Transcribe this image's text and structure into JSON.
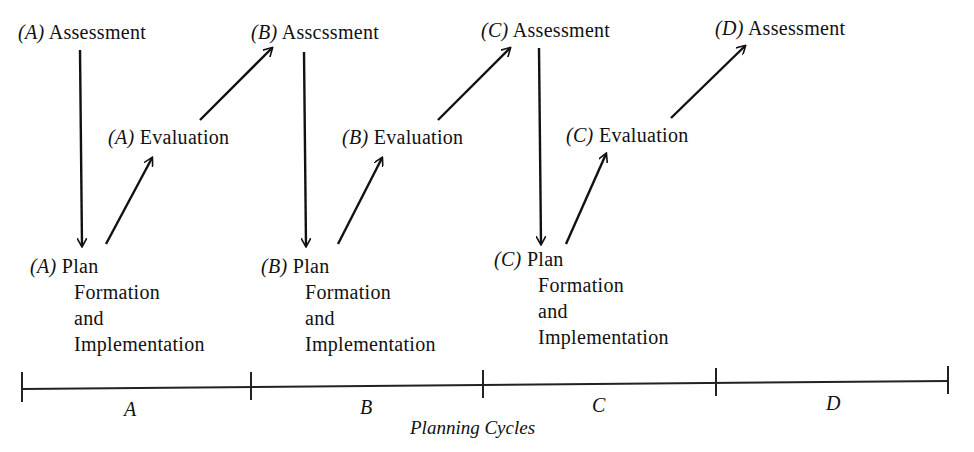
{
  "nodes": {
    "a_assessment": {
      "prefix": "(A)",
      "text": "Assessment"
    },
    "a_evaluation": {
      "prefix": "(A)",
      "text": "Evaluation"
    },
    "a_plan": {
      "prefix": "(A)",
      "lines": [
        "Plan",
        "Formation",
        "and",
        "Implementation"
      ]
    },
    "b_assessment": {
      "prefix": "(B)",
      "text": "Asscssment"
    },
    "b_evaluation": {
      "prefix": "(B)",
      "text": "Evaluation"
    },
    "b_plan": {
      "prefix": "(B)",
      "lines": [
        "Plan",
        "Formation",
        "and",
        "Implementation"
      ]
    },
    "c_assessment": {
      "prefix": "(C)",
      "text": "Assessment"
    },
    "c_evaluation": {
      "prefix": "(C)",
      "text": "Evaluation"
    },
    "c_plan": {
      "prefix": "(C)",
      "lines": [
        "Plan",
        "Formation",
        "and",
        "Implementation"
      ]
    },
    "d_assessment": {
      "prefix": "(D)",
      "text": "Assessment"
    }
  },
  "timeline": {
    "segments": [
      "A",
      "B",
      "C",
      "D"
    ],
    "caption": "Planning Cycles"
  }
}
